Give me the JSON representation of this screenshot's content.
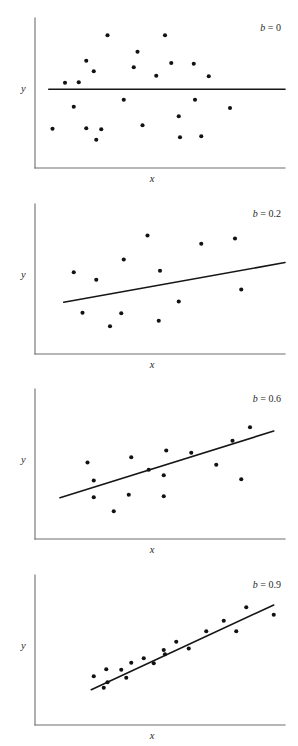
{
  "figure": {
    "title": "",
    "axis_labels": {
      "x": "x",
      "y": "y"
    },
    "colors": {
      "dot": "#121212",
      "regression_line": "#161616",
      "axis": "#6e6e6e",
      "background": "#ffffff",
      "text": "#2a2a2a"
    }
  },
  "chart_data": [
    {
      "type": "scatter",
      "title": "b = 0",
      "slope_label": "b = 0",
      "slope_symbol": "b",
      "slope_value": "0",
      "xlabel": "x",
      "ylabel": "y",
      "xlim": [
        0,
        1
      ],
      "ylim": [
        0,
        1
      ],
      "grid": false,
      "legend": "none",
      "annotation_position": "top-right",
      "regression_line": {
        "x0": 0.055,
        "y0": 0.525,
        "x1": 1.0,
        "y1": 0.525
      },
      "points": [
        {
          "x": 0.29,
          "y": 0.885
        },
        {
          "x": 0.52,
          "y": 0.885
        },
        {
          "x": 0.41,
          "y": 0.775
        },
        {
          "x": 0.205,
          "y": 0.715
        },
        {
          "x": 0.545,
          "y": 0.7
        },
        {
          "x": 0.635,
          "y": 0.695
        },
        {
          "x": 0.395,
          "y": 0.672
        },
        {
          "x": 0.235,
          "y": 0.645
        },
        {
          "x": 0.485,
          "y": 0.615
        },
        {
          "x": 0.695,
          "y": 0.612
        },
        {
          "x": 0.12,
          "y": 0.568
        },
        {
          "x": 0.175,
          "y": 0.572
        },
        {
          "x": 0.355,
          "y": 0.455
        },
        {
          "x": 0.64,
          "y": 0.455
        },
        {
          "x": 0.155,
          "y": 0.408
        },
        {
          "x": 0.78,
          "y": 0.4
        },
        {
          "x": 0.575,
          "y": 0.345
        },
        {
          "x": 0.43,
          "y": 0.285
        },
        {
          "x": 0.205,
          "y": 0.265
        },
        {
          "x": 0.265,
          "y": 0.258
        },
        {
          "x": 0.07,
          "y": 0.262
        },
        {
          "x": 0.58,
          "y": 0.205
        },
        {
          "x": 0.665,
          "y": 0.212
        },
        {
          "x": 0.245,
          "y": 0.188
        }
      ]
    },
    {
      "type": "scatter",
      "title": "b = 0.2",
      "slope_label": "b = 0.2",
      "slope_symbol": "b",
      "slope_value": "0.2",
      "xlabel": "x",
      "ylabel": "y",
      "xlim": [
        0,
        1
      ],
      "ylim": [
        0,
        1
      ],
      "grid": false,
      "legend": "none",
      "annotation_position": "top-right",
      "regression_line": {
        "x0": 0.115,
        "y0": 0.345,
        "x1": 1.0,
        "y1": 0.61
      },
      "points": [
        {
          "x": 0.45,
          "y": 0.79
        },
        {
          "x": 0.8,
          "y": 0.77
        },
        {
          "x": 0.665,
          "y": 0.735
        },
        {
          "x": 0.355,
          "y": 0.63
        },
        {
          "x": 0.5,
          "y": 0.555
        },
        {
          "x": 0.155,
          "y": 0.545
        },
        {
          "x": 0.245,
          "y": 0.495
        },
        {
          "x": 0.825,
          "y": 0.43
        },
        {
          "x": 0.575,
          "y": 0.35
        },
        {
          "x": 0.19,
          "y": 0.275
        },
        {
          "x": 0.345,
          "y": 0.272
        },
        {
          "x": 0.495,
          "y": 0.222
        },
        {
          "x": 0.3,
          "y": 0.185
        }
      ]
    },
    {
      "type": "scatter",
      "title": "b = 0.6",
      "slope_label": "b = 0.6",
      "slope_symbol": "b",
      "slope_value": "0.6",
      "xlabel": "x",
      "ylabel": "y",
      "xlim": [
        0,
        1
      ],
      "ylim": [
        0,
        1
      ],
      "grid": false,
      "legend": "none",
      "annotation_position": "top-right",
      "regression_line": {
        "x0": 0.1,
        "y0": 0.275,
        "x1": 0.955,
        "y1": 0.72
      },
      "points": [
        {
          "x": 0.86,
          "y": 0.745
        },
        {
          "x": 0.79,
          "y": 0.655
        },
        {
          "x": 0.525,
          "y": 0.59
        },
        {
          "x": 0.625,
          "y": 0.575
        },
        {
          "x": 0.385,
          "y": 0.545
        },
        {
          "x": 0.725,
          "y": 0.495
        },
        {
          "x": 0.21,
          "y": 0.51
        },
        {
          "x": 0.455,
          "y": 0.462
        },
        {
          "x": 0.515,
          "y": 0.425
        },
        {
          "x": 0.235,
          "y": 0.39
        },
        {
          "x": 0.825,
          "y": 0.398
        },
        {
          "x": 0.375,
          "y": 0.295
        },
        {
          "x": 0.515,
          "y": 0.285
        },
        {
          "x": 0.235,
          "y": 0.278
        },
        {
          "x": 0.315,
          "y": 0.185
        }
      ]
    },
    {
      "type": "scatter",
      "title": "b = 0.9",
      "slope_label": "b = 0.9",
      "slope_symbol": "b",
      "slope_value": "0.9",
      "xlabel": "x",
      "ylabel": "y",
      "xlim": [
        0,
        1
      ],
      "ylim": [
        0,
        1
      ],
      "grid": false,
      "legend": "none",
      "annotation_position": "top-right",
      "regression_line": {
        "x0": 0.225,
        "y0": 0.235,
        "x1": 0.955,
        "y1": 0.8
      },
      "points": [
        {
          "x": 0.845,
          "y": 0.785
        },
        {
          "x": 0.955,
          "y": 0.735
        },
        {
          "x": 0.755,
          "y": 0.695
        },
        {
          "x": 0.805,
          "y": 0.625
        },
        {
          "x": 0.685,
          "y": 0.625
        },
        {
          "x": 0.565,
          "y": 0.555
        },
        {
          "x": 0.615,
          "y": 0.51
        },
        {
          "x": 0.515,
          "y": 0.5
        },
        {
          "x": 0.52,
          "y": 0.472
        },
        {
          "x": 0.435,
          "y": 0.445
        },
        {
          "x": 0.385,
          "y": 0.415
        },
        {
          "x": 0.475,
          "y": 0.412
        },
        {
          "x": 0.345,
          "y": 0.368
        },
        {
          "x": 0.285,
          "y": 0.372
        },
        {
          "x": 0.365,
          "y": 0.315
        },
        {
          "x": 0.235,
          "y": 0.325
        },
        {
          "x": 0.29,
          "y": 0.285
        },
        {
          "x": 0.275,
          "y": 0.248
        }
      ]
    }
  ]
}
